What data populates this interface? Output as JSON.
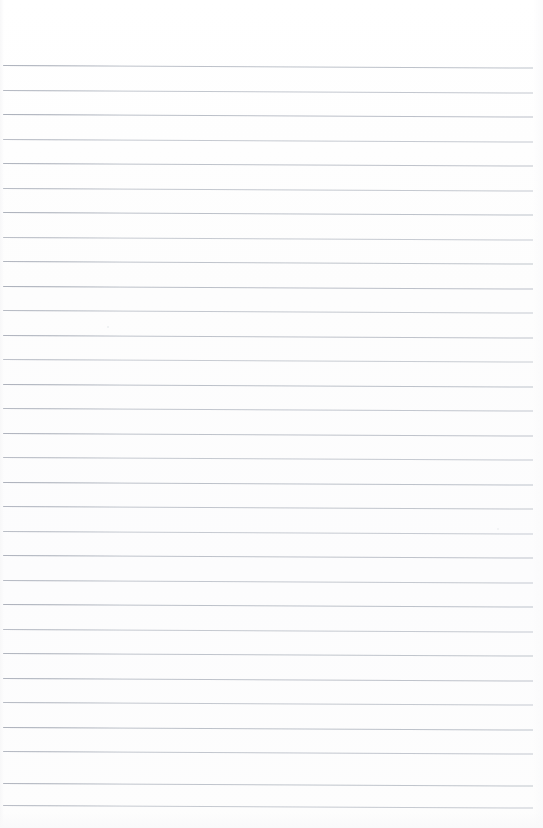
{
  "document": {
    "kind": "scanned-page",
    "title": "Blank Lined Notebook Page",
    "description": "Blank ruled notebook paper, no handwriting or printed text",
    "page_label": "",
    "text_content": "",
    "width_px": 543,
    "height_px": 828
  },
  "paper": {
    "background_color": "#fefefe",
    "rule_color": "#b6bbc4",
    "rule_thickness_px": 1,
    "rule_spacing_px": 24.6,
    "first_rule_y_px": 65,
    "last_rule_y_px": 805,
    "rule_start_x_px": 3,
    "rule_end_x_px": 533,
    "skew_deg": 0.28,
    "margin_rule": "none",
    "holes": "none",
    "rule_count": 31
  },
  "rules": [
    {
      "y": 65,
      "x": 3,
      "w": 530,
      "opacity": 0.9
    },
    {
      "y": 90,
      "x": 3,
      "w": 530,
      "opacity": 0.82
    },
    {
      "y": 114,
      "x": 3,
      "w": 530,
      "opacity": 0.92
    },
    {
      "y": 139,
      "x": 3,
      "w": 530,
      "opacity": 0.78
    },
    {
      "y": 163,
      "x": 3,
      "w": 530,
      "opacity": 0.88
    },
    {
      "y": 188,
      "x": 3,
      "w": 530,
      "opacity": 0.8
    },
    {
      "y": 212,
      "x": 3,
      "w": 530,
      "opacity": 0.9
    },
    {
      "y": 237,
      "x": 3,
      "w": 530,
      "opacity": 0.76
    },
    {
      "y": 261,
      "x": 3,
      "w": 530,
      "opacity": 0.86
    },
    {
      "y": 286,
      "x": 3,
      "w": 530,
      "opacity": 0.92
    },
    {
      "y": 310,
      "x": 3,
      "w": 530,
      "opacity": 0.8
    },
    {
      "y": 335,
      "x": 3,
      "w": 530,
      "opacity": 0.88
    },
    {
      "y": 359,
      "x": 3,
      "w": 530,
      "opacity": 0.74
    },
    {
      "y": 384,
      "x": 3,
      "w": 530,
      "opacity": 0.9
    },
    {
      "y": 408,
      "x": 3,
      "w": 530,
      "opacity": 0.82
    },
    {
      "y": 433,
      "x": 3,
      "w": 530,
      "opacity": 0.88
    },
    {
      "y": 457,
      "x": 3,
      "w": 530,
      "opacity": 0.78
    },
    {
      "y": 482,
      "x": 3,
      "w": 530,
      "opacity": 0.9
    },
    {
      "y": 506,
      "x": 3,
      "w": 530,
      "opacity": 0.84
    },
    {
      "y": 531,
      "x": 3,
      "w": 530,
      "opacity": 0.76
    },
    {
      "y": 555,
      "x": 3,
      "w": 530,
      "opacity": 0.88
    },
    {
      "y": 580,
      "x": 3,
      "w": 530,
      "opacity": 0.8
    },
    {
      "y": 604,
      "x": 3,
      "w": 530,
      "opacity": 0.9
    },
    {
      "y": 629,
      "x": 3,
      "w": 530,
      "opacity": 0.78
    },
    {
      "y": 653,
      "x": 3,
      "w": 530,
      "opacity": 0.86
    },
    {
      "y": 678,
      "x": 3,
      "w": 530,
      "opacity": 0.88
    },
    {
      "y": 702,
      "x": 3,
      "w": 530,
      "opacity": 0.8
    },
    {
      "y": 727,
      "x": 3,
      "w": 530,
      "opacity": 0.9
    },
    {
      "y": 751,
      "x": 3,
      "w": 530,
      "opacity": 0.82
    },
    {
      "y": 783,
      "x": 3,
      "w": 530,
      "opacity": 0.86
    },
    {
      "y": 805,
      "x": 3,
      "w": 530,
      "opacity": 0.78
    }
  ],
  "specks": [
    {
      "x": 107,
      "y": 326,
      "d": 2.2,
      "opacity": 0.55
    },
    {
      "x": 497,
      "y": 528,
      "d": 1.8,
      "opacity": 0.4
    }
  ]
}
